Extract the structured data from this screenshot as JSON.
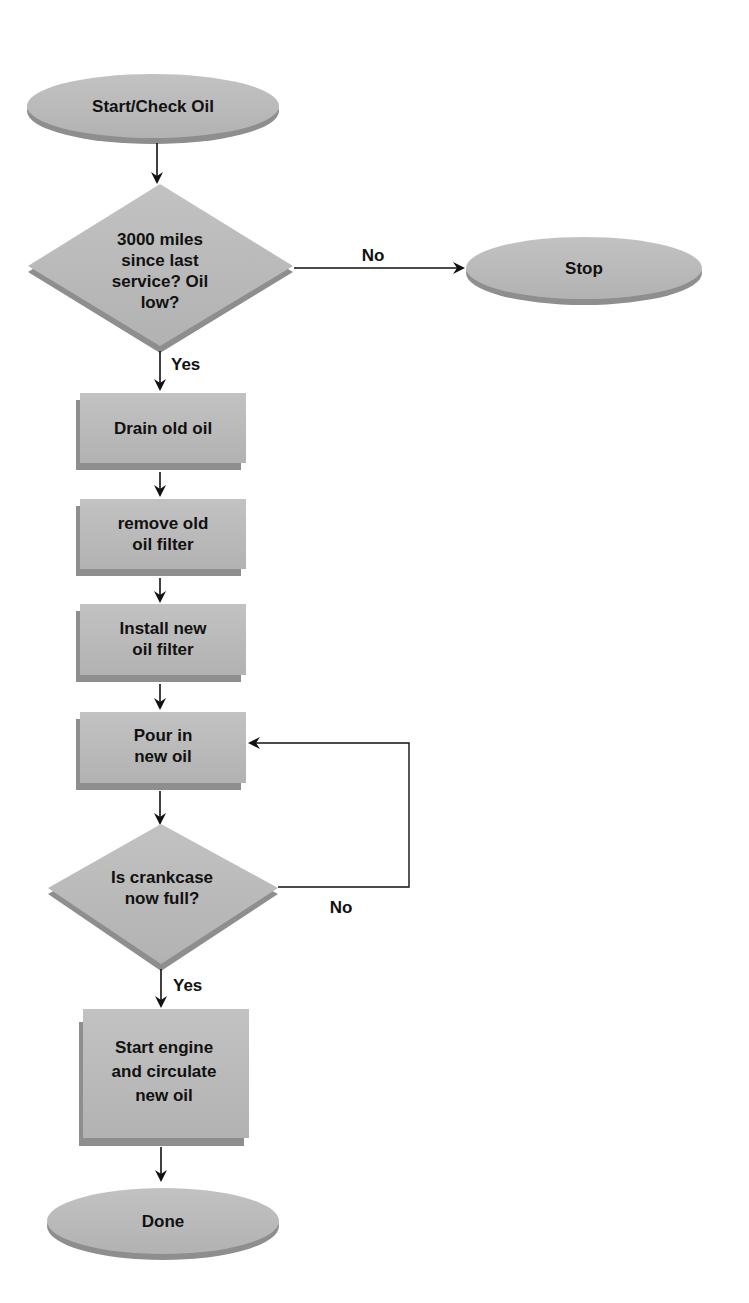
{
  "diagram": {
    "type": "flowchart",
    "colors": {
      "shape_fill": "#b9b9b9",
      "shape_shadow": "#8e8e8e",
      "text": "#111111",
      "line": "#111111",
      "background": "#ffffff"
    },
    "nodes": {
      "start": {
        "shape": "terminal",
        "label": "Start/Check Oil"
      },
      "decision_service": {
        "shape": "decision",
        "lines": [
          "3000 miles",
          "since last",
          "service? Oil",
          "low?"
        ]
      },
      "stop": {
        "shape": "terminal",
        "label": "Stop"
      },
      "drain": {
        "shape": "process",
        "lines": [
          "Drain old oil"
        ]
      },
      "remove_filter": {
        "shape": "process",
        "lines": [
          "remove old",
          "oil filter"
        ]
      },
      "install_filter": {
        "shape": "process",
        "lines": [
          "Install new",
          "oil filter"
        ]
      },
      "pour": {
        "shape": "process",
        "lines": [
          "Pour in",
          "new oil"
        ]
      },
      "decision_full": {
        "shape": "decision",
        "lines": [
          "Is crankcase",
          "now full?"
        ]
      },
      "start_engine": {
        "shape": "process",
        "lines": [
          "Start engine",
          "and circulate",
          "new oil"
        ]
      },
      "done": {
        "shape": "terminal",
        "label": "Done"
      }
    },
    "edges": [
      {
        "from": "start",
        "to": "decision_service",
        "label": ""
      },
      {
        "from": "decision_service",
        "to": "stop",
        "label": "No"
      },
      {
        "from": "decision_service",
        "to": "drain",
        "label": "Yes"
      },
      {
        "from": "drain",
        "to": "remove_filter",
        "label": ""
      },
      {
        "from": "remove_filter",
        "to": "install_filter",
        "label": ""
      },
      {
        "from": "install_filter",
        "to": "pour",
        "label": ""
      },
      {
        "from": "pour",
        "to": "decision_full",
        "label": ""
      },
      {
        "from": "decision_full",
        "to": "pour",
        "label": "No"
      },
      {
        "from": "decision_full",
        "to": "start_engine",
        "label": "Yes"
      },
      {
        "from": "start_engine",
        "to": "done",
        "label": ""
      }
    ],
    "edge_labels": {
      "service_no": "No",
      "service_yes": "Yes",
      "full_no": "No",
      "full_yes": "Yes"
    }
  }
}
